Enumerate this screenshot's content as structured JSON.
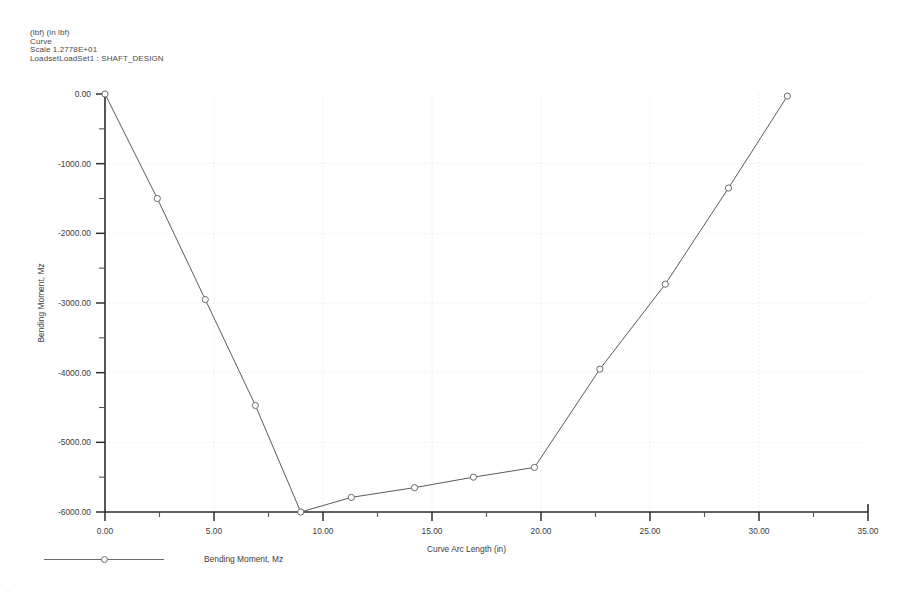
{
  "header": {
    "units": "(lbf)  (in lbf)",
    "type": "Curve",
    "scale": "Scale  1.2778E+01",
    "loadset": "LoadsetLoadSet1 : SHAFT_DESIGN"
  },
  "legend": {
    "entry_label": "Bending Moment, Mz",
    "marker_icon": "circle-marker-icon"
  },
  "footer": {
    "smudge_text": ". . ."
  },
  "chart_data": {
    "type": "line",
    "title": "",
    "xlabel": "Curve Arc Length (in)",
    "ylabel": "Bending Moment, Mz",
    "xlim": [
      0,
      35
    ],
    "ylim": [
      -6000,
      0
    ],
    "xticks": [
      0,
      5,
      10,
      15,
      20,
      25,
      30,
      35
    ],
    "xtick_labels": [
      "0.00",
      "5.00",
      "10.00",
      "15.00",
      "20.00",
      "25.00",
      "30.00",
      "35.00"
    ],
    "yticks": [
      0,
      -1000,
      -2000,
      -3000,
      -4000,
      -5000,
      -6000
    ],
    "ytick_labels": [
      "0.00",
      "-1000.00",
      "-2000.00",
      "-3000.00",
      "-4000.00",
      "-5000.00",
      "-6000.00"
    ],
    "x_minor_per_major": 2,
    "y_minor_per_major": 2,
    "grid": true,
    "grid_style": "dotted",
    "legend_position": "below-left",
    "series": [
      {
        "name": "Bending Moment, Mz",
        "color": "#5a5a62",
        "marker": "circle",
        "x": [
          0.0,
          2.4,
          4.6,
          6.9,
          8.98,
          11.3,
          14.2,
          16.9,
          19.7,
          22.7,
          25.7,
          28.6,
          31.3
        ],
        "values": [
          0,
          -1500,
          -2950,
          -4470,
          -6000,
          -5790,
          -5650,
          -5500,
          -5360,
          -3950,
          -2730,
          -1350,
          -30
        ]
      }
    ]
  }
}
